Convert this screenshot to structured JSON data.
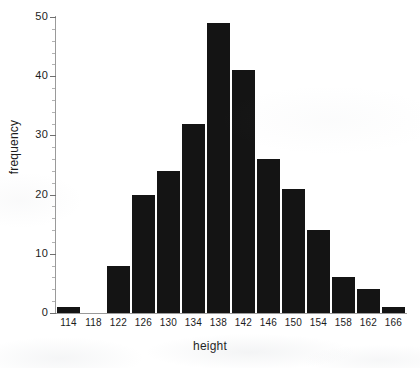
{
  "chart_data": {
    "type": "bar",
    "title": "",
    "subtitle": "",
    "xlabel": "height",
    "ylabel": "frequency",
    "categories": [
      "114",
      "118",
      "122",
      "126",
      "130",
      "134",
      "138",
      "142",
      "146",
      "150",
      "154",
      "158",
      "162",
      "166"
    ],
    "values": [
      1,
      0,
      8,
      20,
      24,
      32,
      49,
      41,
      26,
      21,
      14,
      6,
      4,
      1
    ],
    "xlim": [
      112,
      168
    ],
    "ylim": [
      0,
      50
    ],
    "y_ticks": [
      "0",
      "10",
      "20",
      "30",
      "40",
      "50"
    ],
    "y_tick_values": [
      0,
      10,
      20,
      30,
      40,
      50
    ],
    "y_minor_tick_step": 2,
    "x_ticks": [
      "114",
      "118",
      "122",
      "126",
      "130",
      "134",
      "138",
      "142",
      "146",
      "150",
      "154",
      "158",
      "162",
      "166"
    ],
    "grid": false,
    "legend": null,
    "bar_color": "#141414",
    "axis_color": "#9a9a9a",
    "text_color": "#1c1c1c",
    "background": "#ffffff",
    "annotations": []
  },
  "axis_titles": {
    "x": "height",
    "y": "frequency"
  }
}
